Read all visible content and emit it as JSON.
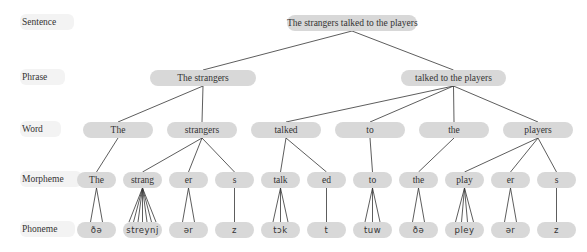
{
  "row_labels": [
    {
      "id": "sentence",
      "label": "Sentence",
      "y": 23
    },
    {
      "id": "phrase",
      "label": "Phrase",
      "y": 78
    },
    {
      "id": "word",
      "label": "Word",
      "y": 130
    },
    {
      "id": "morpheme",
      "label": "Morpheme",
      "y": 180
    },
    {
      "id": "phoneme",
      "label": "Phoneme",
      "y": 230
    }
  ],
  "colors": {
    "pill": "#d8d8d8",
    "text": "#333333",
    "line": "#333333"
  },
  "nodes": {
    "sentence": [
      {
        "id": "s0",
        "label": "The strangers talked to the players",
        "x": 287,
        "w": 130
      }
    ],
    "phrase": [
      {
        "id": "p0",
        "label": "The strangers",
        "x": 150,
        "w": 106,
        "parent": "s0"
      },
      {
        "id": "p1",
        "label": "talked to the players",
        "x": 401,
        "w": 105,
        "parent": "s0"
      }
    ],
    "word": [
      {
        "id": "w0",
        "label": "The",
        "x": 83,
        "w": 70,
        "parent": "p0"
      },
      {
        "id": "w1",
        "label": "strangers",
        "x": 167,
        "w": 70,
        "parent": "p0"
      },
      {
        "id": "w2",
        "label": "talked",
        "x": 251,
        "w": 70,
        "parent": "p1"
      },
      {
        "id": "w3",
        "label": "to",
        "x": 335,
        "w": 70,
        "parent": "p1"
      },
      {
        "id": "w4",
        "label": "the",
        "x": 419,
        "w": 70,
        "parent": "p1"
      },
      {
        "id": "w5",
        "label": "players",
        "x": 503,
        "w": 70,
        "parent": "p1"
      }
    ],
    "morpheme": [
      {
        "id": "m0",
        "label": "The",
        "x": 77,
        "w": 39,
        "parent": "w0",
        "fan": 2
      },
      {
        "id": "m1",
        "label": "strang",
        "x": 123,
        "w": 39,
        "parent": "w1",
        "fan": 7
      },
      {
        "id": "m2",
        "label": "er",
        "x": 169,
        "w": 39,
        "parent": "w1",
        "fan": 2
      },
      {
        "id": "m3",
        "label": "s",
        "x": 215,
        "w": 39,
        "parent": "w1",
        "fan": 1
      },
      {
        "id": "m4",
        "label": "talk",
        "x": 261,
        "w": 39,
        "parent": "w2",
        "fan": 3
      },
      {
        "id": "m5",
        "label": "ed",
        "x": 307,
        "w": 39,
        "parent": "w2",
        "fan": 1
      },
      {
        "id": "m6",
        "label": "to",
        "x": 353,
        "w": 39,
        "parent": "w3",
        "fan": 3
      },
      {
        "id": "m7",
        "label": "the",
        "x": 399,
        "w": 39,
        "parent": "w4",
        "fan": 2
      },
      {
        "id": "m8",
        "label": "play",
        "x": 445,
        "w": 39,
        "parent": "w5",
        "fan": 4
      },
      {
        "id": "m9",
        "label": "er",
        "x": 491,
        "w": 39,
        "parent": "w5",
        "fan": 2
      },
      {
        "id": "m10",
        "label": "s",
        "x": 537,
        "w": 39,
        "parent": "w5",
        "fan": 1
      }
    ],
    "phoneme": [
      {
        "id": "f0",
        "label": "ðə",
        "x": 77,
        "w": 39,
        "parent": "m0"
      },
      {
        "id": "f1",
        "label": "streynj",
        "x": 123,
        "w": 39,
        "parent": "m1"
      },
      {
        "id": "f2",
        "label": "ər",
        "x": 169,
        "w": 39,
        "parent": "m2"
      },
      {
        "id": "f3",
        "label": "z",
        "x": 215,
        "w": 39,
        "parent": "m3"
      },
      {
        "id": "f4",
        "label": "tɔk",
        "x": 261,
        "w": 39,
        "parent": "m4"
      },
      {
        "id": "f5",
        "label": "t",
        "x": 307,
        "w": 39,
        "parent": "m5"
      },
      {
        "id": "f6",
        "label": "tuw",
        "x": 353,
        "w": 39,
        "parent": "m6"
      },
      {
        "id": "f7",
        "label": "ðə",
        "x": 399,
        "w": 39,
        "parent": "m7"
      },
      {
        "id": "f8",
        "label": "pley",
        "x": 445,
        "w": 39,
        "parent": "m8"
      },
      {
        "id": "f9",
        "label": "ər",
        "x": 491,
        "w": 39,
        "parent": "m9"
      },
      {
        "id": "f10",
        "label": "z",
        "x": 537,
        "w": 39,
        "parent": "m10"
      }
    ]
  }
}
